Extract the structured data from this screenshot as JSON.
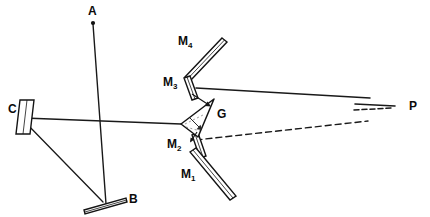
{
  "figure": {
    "background_color": "#ffffff",
    "ink_color": "#141414",
    "width": 430,
    "height": 217
  },
  "labels": {
    "a": "A",
    "b": "B",
    "c": "C",
    "g": "G",
    "p": "P",
    "m1_base": "M",
    "m1_sub": "1",
    "m2_base": "M",
    "m2_sub": "2",
    "m3_base": "M",
    "m3_sub": "3",
    "m4_base": "M",
    "m4_sub": "4"
  },
  "components": [
    {
      "id": "A",
      "label": "A",
      "kind": "source-point",
      "x": 92,
      "y": 22
    },
    {
      "id": "B",
      "label": "B",
      "kind": "mirror",
      "x": 110,
      "y": 205
    },
    {
      "id": "C",
      "label": "C",
      "kind": "mirror",
      "x": 26,
      "y": 117
    },
    {
      "id": "G",
      "label": "G",
      "kind": "prism",
      "x": 196,
      "y": 117
    },
    {
      "id": "M1",
      "label": "M1",
      "kind": "mirror",
      "x": 208,
      "y": 172
    },
    {
      "id": "M2",
      "label": "M2",
      "kind": "mirror",
      "x": 189,
      "y": 146
    },
    {
      "id": "M3",
      "label": "M3",
      "kind": "mirror",
      "x": 190,
      "y": 85
    },
    {
      "id": "M4",
      "label": "M4",
      "kind": "mirror",
      "x": 205,
      "y": 58
    },
    {
      "id": "P",
      "label": "P",
      "kind": "screen-point",
      "x": 400,
      "y": 108
    }
  ],
  "rays": [
    {
      "from": "A",
      "to": "B",
      "style": "solid"
    },
    {
      "from": "C",
      "to": "B",
      "style": "solid"
    },
    {
      "from": "C",
      "to": "G",
      "style": "solid"
    },
    {
      "from": "M3",
      "to": "P",
      "style": "solid"
    },
    {
      "from": "M2",
      "to": "P",
      "style": "dashed"
    },
    {
      "from": "M3",
      "to": "G",
      "style": "arrow"
    },
    {
      "from": "G",
      "to": "M2",
      "style": "arrow"
    }
  ]
}
